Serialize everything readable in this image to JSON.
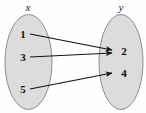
{
  "figure": {
    "background_color": "#fefefe",
    "sets": [
      {
        "id": "x",
        "label": "x",
        "side": "left",
        "fill_color": "#dcdcdc",
        "stroke_color": "#8c8c8c",
        "elements": [
          "1",
          "3",
          "5"
        ]
      },
      {
        "id": "y",
        "label": "y",
        "side": "right",
        "fill_color": "#dcdcdc",
        "stroke_color": "#8c8c8c",
        "elements": [
          "2",
          "4"
        ]
      }
    ],
    "arrows": [
      {
        "from": "1",
        "to": "2",
        "color": "#111111"
      },
      {
        "from": "3",
        "to": "2",
        "color": "#111111"
      },
      {
        "from": "5",
        "to": "4",
        "color": "#111111"
      }
    ]
  }
}
